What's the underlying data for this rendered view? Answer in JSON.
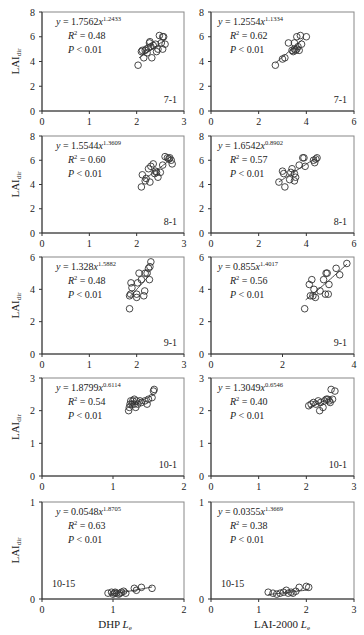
{
  "figure": {
    "ylabel": "LAI",
    "ylabel_sub": "dir",
    "xlabel_left": "DHP",
    "xlabel_left_var": "L",
    "xlabel_left_sub": "e",
    "xlabel_right": "LAI-2000",
    "xlabel_right_var": "L",
    "xlabel_right_sub": "e"
  },
  "chart_data": [
    {
      "type": "scatter",
      "panel": "7-1 DHP",
      "title": "7-1",
      "xlabel": "DHP Le",
      "ylabel": "LAIdir",
      "xlim": [
        0,
        3
      ],
      "ylim": [
        0,
        8
      ],
      "xticks": [
        0,
        1,
        2,
        3
      ],
      "yticks": [
        0,
        2,
        4,
        6,
        8
      ],
      "equation": {
        "coef": "1.7562",
        "exp": "1.2433"
      },
      "r2": "0.48",
      "p": "< 0.01",
      "points": [
        [
          2.03,
          3.7
        ],
        [
          2.1,
          4.8
        ],
        [
          2.12,
          4.9
        ],
        [
          2.15,
          4.3
        ],
        [
          2.18,
          4.9
        ],
        [
          2.2,
          5.0
        ],
        [
          2.22,
          4.7
        ],
        [
          2.25,
          5.1
        ],
        [
          2.27,
          5.5
        ],
        [
          2.28,
          5.6
        ],
        [
          2.3,
          5.2
        ],
        [
          2.32,
          4.3
        ],
        [
          2.35,
          5.3
        ],
        [
          2.4,
          5.4
        ],
        [
          2.42,
          4.8
        ],
        [
          2.45,
          5.0
        ],
        [
          2.48,
          6.1
        ],
        [
          2.52,
          5.5
        ],
        [
          2.55,
          6.0
        ],
        [
          2.55,
          5.0
        ],
        [
          2.57,
          6.0
        ],
        [
          2.6,
          5.4
        ]
      ],
      "fit_x": [
        2.05,
        2.6
      ]
    },
    {
      "type": "scatter",
      "panel": "7-1 LAI-2000",
      "title": "7-1",
      "xlabel": "LAI-2000 Le",
      "ylabel": "LAIdir",
      "xlim": [
        0,
        6
      ],
      "ylim": [
        0,
        8
      ],
      "xticks": [
        0,
        2,
        4,
        6
      ],
      "yticks": [
        0,
        2,
        4,
        6,
        8
      ],
      "equation": {
        "coef": "1.2554",
        "exp": "1.1334"
      },
      "r2": "0.62",
      "p": "< 0.01",
      "points": [
        [
          2.7,
          3.7
        ],
        [
          3.0,
          4.2
        ],
        [
          3.1,
          4.3
        ],
        [
          3.25,
          5.5
        ],
        [
          3.4,
          4.9
        ],
        [
          3.45,
          4.8
        ],
        [
          3.5,
          5.0
        ],
        [
          3.5,
          5.5
        ],
        [
          3.55,
          4.9
        ],
        [
          3.6,
          5.0
        ],
        [
          3.6,
          6.0
        ],
        [
          3.65,
          5.2
        ],
        [
          3.7,
          4.9
        ],
        [
          3.75,
          6.1
        ],
        [
          3.8,
          5.4
        ],
        [
          4.0,
          6.0
        ]
      ],
      "fit_x": [
        2.7,
        3.9
      ]
    },
    {
      "type": "scatter",
      "panel": "8-1 DHP",
      "title": "8-1",
      "xlabel": "DHP Le",
      "ylabel": "LAIdir",
      "xlim": [
        0,
        3
      ],
      "ylim": [
        0,
        8
      ],
      "xticks": [
        0,
        1,
        2,
        3
      ],
      "yticks": [
        0,
        2,
        4,
        6,
        8
      ],
      "equation": {
        "coef": "1.5544",
        "exp": "1.3609"
      },
      "r2": "0.60",
      "p": "< 0.01",
      "points": [
        [
          2.1,
          3.8
        ],
        [
          2.12,
          4.8
        ],
        [
          2.18,
          4.3
        ],
        [
          2.2,
          4.5
        ],
        [
          2.25,
          5.3
        ],
        [
          2.28,
          4.2
        ],
        [
          2.3,
          5.5
        ],
        [
          2.35,
          5.7
        ],
        [
          2.38,
          4.9
        ],
        [
          2.4,
          5.1
        ],
        [
          2.42,
          5.0
        ],
        [
          2.45,
          4.6
        ],
        [
          2.5,
          5.0
        ],
        [
          2.55,
          5.6
        ],
        [
          2.6,
          6.3
        ],
        [
          2.65,
          6.2
        ],
        [
          2.68,
          6.1
        ],
        [
          2.7,
          6.2
        ],
        [
          2.73,
          6.0
        ],
        [
          2.75,
          5.7
        ]
      ],
      "fit_x": [
        2.15,
        2.75
      ]
    },
    {
      "type": "scatter",
      "panel": "8-1 LAI-2000",
      "title": "8-1",
      "xlabel": "LAI-2000 Le",
      "ylabel": "LAIdir",
      "xlim": [
        0,
        6
      ],
      "ylim": [
        0,
        8
      ],
      "xticks": [
        0,
        2,
        4,
        6
      ],
      "yticks": [
        0,
        2,
        4,
        6,
        8
      ],
      "equation": {
        "coef": "1.6542",
        "exp": "0.8902"
      },
      "r2": "0.57",
      "p": "< 0.01",
      "points": [
        [
          2.85,
          4.2
        ],
        [
          3.0,
          5.1
        ],
        [
          3.05,
          4.9
        ],
        [
          3.1,
          3.8
        ],
        [
          3.3,
          4.4
        ],
        [
          3.35,
          5.0
        ],
        [
          3.4,
          5.3
        ],
        [
          3.5,
          4.9
        ],
        [
          3.5,
          4.3
        ],
        [
          3.55,
          4.6
        ],
        [
          3.7,
          5.6
        ],
        [
          3.85,
          6.2
        ],
        [
          3.9,
          6.2
        ],
        [
          3.95,
          5.5
        ],
        [
          4.3,
          6.0
        ],
        [
          4.35,
          5.8
        ],
        [
          4.4,
          6.1
        ],
        [
          4.45,
          6.2
        ]
      ],
      "fit_x": [
        2.85,
        4.45
      ]
    },
    {
      "type": "scatter",
      "panel": "9-1 DHP",
      "title": "9-1",
      "xlabel": "DHP Le",
      "ylabel": "LAIdir",
      "xlim": [
        0,
        3
      ],
      "ylim": [
        0,
        6
      ],
      "xticks": [
        0,
        1,
        2,
        3
      ],
      "yticks": [
        0,
        2,
        4,
        6
      ],
      "equation": {
        "coef": "1.328",
        "exp": "1.5882"
      },
      "r2": "0.48",
      "p": "< 0.01",
      "points": [
        [
          1.85,
          2.8
        ],
        [
          1.85,
          3.6
        ],
        [
          1.87,
          3.7
        ],
        [
          1.88,
          4.4
        ],
        [
          1.9,
          4.1
        ],
        [
          2.0,
          3.5
        ],
        [
          2.0,
          3.7
        ],
        [
          2.02,
          4.4
        ],
        [
          2.05,
          5.0
        ],
        [
          2.1,
          4.6
        ],
        [
          2.15,
          3.6
        ],
        [
          2.17,
          3.9
        ],
        [
          2.18,
          5.0
        ],
        [
          2.22,
          5.0
        ],
        [
          2.25,
          5.3
        ],
        [
          2.27,
          4.6
        ],
        [
          2.28,
          5.4
        ],
        [
          2.3,
          5.7
        ]
      ],
      "fit_x": [
        1.85,
        2.28
      ]
    },
    {
      "type": "scatter",
      "panel": "9-1 LAI-2000",
      "title": "9-1",
      "xlabel": "LAI-2000 Le",
      "ylabel": "LAIdir",
      "xlim": [
        0,
        4
      ],
      "ylim": [
        0,
        6
      ],
      "xticks": [
        0,
        2,
        4
      ],
      "yticks": [
        0,
        2,
        4,
        6
      ],
      "equation": {
        "coef": "0.855",
        "exp": "1.4017"
      },
      "r2": "0.56",
      "p": "< 0.01",
      "points": [
        [
          2.62,
          2.8
        ],
        [
          2.75,
          4.3
        ],
        [
          2.78,
          3.6
        ],
        [
          2.82,
          4.6
        ],
        [
          2.85,
          3.6
        ],
        [
          2.88,
          4.0
        ],
        [
          2.92,
          3.5
        ],
        [
          3.05,
          3.9
        ],
        [
          3.15,
          4.6
        ],
        [
          3.2,
          3.7
        ],
        [
          3.22,
          5.0
        ],
        [
          3.25,
          5.0
        ],
        [
          3.28,
          3.7
        ],
        [
          3.3,
          4.3
        ],
        [
          3.5,
          5.3
        ],
        [
          3.6,
          4.9
        ],
        [
          3.8,
          5.6
        ]
      ],
      "fit_x": [
        2.65,
        3.8
      ]
    },
    {
      "type": "scatter",
      "panel": "10-1 DHP",
      "title": "10-1",
      "xlabel": "DHP Le",
      "ylabel": "LAIdir",
      "xlim": [
        0,
        2
      ],
      "ylim": [
        0,
        3
      ],
      "xticks": [
        0,
        1,
        2
      ],
      "yticks": [
        0,
        1,
        2,
        3
      ],
      "equation": {
        "coef": "1.8799",
        "exp": "0.6114"
      },
      "r2": "0.54",
      "p": "< 0.01",
      "points": [
        [
          1.22,
          2.0
        ],
        [
          1.23,
          2.1
        ],
        [
          1.24,
          2.2
        ],
        [
          1.25,
          2.3
        ],
        [
          1.27,
          2.2
        ],
        [
          1.28,
          2.3
        ],
        [
          1.3,
          2.35
        ],
        [
          1.3,
          2.2
        ],
        [
          1.32,
          2.1
        ],
        [
          1.33,
          2.3
        ],
        [
          1.35,
          2.2
        ],
        [
          1.38,
          2.3
        ],
        [
          1.4,
          2.25
        ],
        [
          1.45,
          2.3
        ],
        [
          1.48,
          2.2
        ],
        [
          1.5,
          2.35
        ],
        [
          1.55,
          2.4
        ],
        [
          1.57,
          2.6
        ],
        [
          1.58,
          2.65
        ]
      ],
      "fit_x": [
        1.22,
        1.58
      ]
    },
    {
      "type": "scatter",
      "panel": "10-1 LAI-2000",
      "title": "10-1",
      "xlabel": "LAI-2000 Le",
      "ylabel": "LAIdir",
      "xlim": [
        0,
        3
      ],
      "ylim": [
        0,
        3
      ],
      "xticks": [
        0,
        1,
        2,
        3
      ],
      "yticks": [
        0,
        1,
        2,
        3
      ],
      "equation": {
        "coef": "1.3049",
        "exp": "0.6546"
      },
      "r2": "0.40",
      "p": "< 0.01",
      "points": [
        [
          2.05,
          2.15
        ],
        [
          2.1,
          2.2
        ],
        [
          2.15,
          2.25
        ],
        [
          2.2,
          2.2
        ],
        [
          2.25,
          2.3
        ],
        [
          2.28,
          2.0
        ],
        [
          2.3,
          2.25
        ],
        [
          2.35,
          2.1
        ],
        [
          2.38,
          2.3
        ],
        [
          2.42,
          2.35
        ],
        [
          2.45,
          2.35
        ],
        [
          2.48,
          2.3
        ],
        [
          2.5,
          2.25
        ],
        [
          2.52,
          2.65
        ],
        [
          2.55,
          2.35
        ],
        [
          2.6,
          2.6
        ]
      ],
      "fit_x": [
        2.05,
        2.55
      ]
    },
    {
      "type": "scatter",
      "panel": "10-15 DHP",
      "title": "10-15",
      "xlabel": "DHP Le",
      "ylabel": "LAIdir",
      "xlim": [
        0,
        2
      ],
      "ylim": [
        0,
        1
      ],
      "xticks": [
        0,
        1,
        2
      ],
      "yticks": [
        0,
        1
      ],
      "equation": {
        "coef": "0.0548",
        "exp": "1.8705"
      },
      "r2": "0.63",
      "p": "< 0.01",
      "points": [
        [
          0.93,
          0.06
        ],
        [
          0.98,
          0.07
        ],
        [
          1.0,
          0.05
        ],
        [
          1.02,
          0.06
        ],
        [
          1.03,
          0.07
        ],
        [
          1.05,
          0.06
        ],
        [
          1.08,
          0.05
        ],
        [
          1.1,
          0.06
        ],
        [
          1.12,
          0.07
        ],
        [
          1.15,
          0.08
        ],
        [
          1.18,
          0.06
        ],
        [
          1.3,
          0.11
        ],
        [
          1.33,
          0.09
        ],
        [
          1.4,
          0.12
        ],
        [
          1.55,
          0.11
        ]
      ],
      "fit_x": [
        0.95,
        1.55
      ]
    },
    {
      "type": "scatter",
      "panel": "10-15 LAI-2000",
      "title": "10-15",
      "xlabel": "LAI-2000 Le",
      "ylabel": "LAIdir",
      "xlim": [
        0,
        3
      ],
      "ylim": [
        0,
        1
      ],
      "xticks": [
        0,
        1,
        2,
        3
      ],
      "yticks": [
        0,
        1
      ],
      "equation": {
        "coef": "0.0355",
        "exp": "1.3669"
      },
      "r2": "0.38",
      "p": "< 0.01",
      "points": [
        [
          1.2,
          0.07
        ],
        [
          1.3,
          0.06
        ],
        [
          1.38,
          0.05
        ],
        [
          1.45,
          0.06
        ],
        [
          1.52,
          0.07
        ],
        [
          1.58,
          0.09
        ],
        [
          1.62,
          0.06
        ],
        [
          1.68,
          0.07
        ],
        [
          1.72,
          0.06
        ],
        [
          1.78,
          0.08
        ],
        [
          1.85,
          0.12
        ],
        [
          2.0,
          0.13
        ],
        [
          2.05,
          0.12
        ]
      ],
      "fit_x": [
        1.2,
        2.05
      ]
    }
  ]
}
